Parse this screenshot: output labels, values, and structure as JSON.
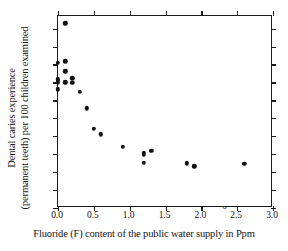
{
  "chart_data": {
    "type": "scatter",
    "title": "",
    "xlabel": "Fluoride (F) content of the public water supply in Ppm",
    "ylabel_line1": "Dental caries experience",
    "ylabel_line2": "(permanent teeth) per 100 children examined",
    "xlim": [
      0.0,
      3.0
    ],
    "ylim": [
      0,
      1070
    ],
    "xticks": [
      "0.0",
      "0.5",
      "1.0",
      "1.5",
      "2.0",
      "2.5",
      "3.0"
    ],
    "xtick_values": [
      0.0,
      0.5,
      1.0,
      1.5,
      2.0,
      2.5,
      3.0
    ],
    "yticks": [
      "0",
      "100",
      "200",
      "300",
      "400",
      "500",
      "600",
      "700",
      "800",
      "900",
      "1000"
    ],
    "ytick_values": [
      0,
      100,
      200,
      300,
      400,
      500,
      600,
      700,
      800,
      900,
      1000
    ],
    "grid": false,
    "legend": null,
    "marker": "filled-circle",
    "marker_color": "#111111",
    "points": [
      {
        "x": 0.1,
        "y": 1030
      },
      {
        "x": 0.0,
        "y": 808
      },
      {
        "x": 0.1,
        "y": 818
      },
      {
        "x": 0.1,
        "y": 762
      },
      {
        "x": 0.0,
        "y": 718
      },
      {
        "x": 0.2,
        "y": 722
      },
      {
        "x": 0.0,
        "y": 700
      },
      {
        "x": 0.1,
        "y": 700
      },
      {
        "x": 0.2,
        "y": 698
      },
      {
        "x": 0.0,
        "y": 662
      },
      {
        "x": 0.3,
        "y": 648
      },
      {
        "x": 0.4,
        "y": 555
      },
      {
        "x": 0.5,
        "y": 442
      },
      {
        "x": 0.6,
        "y": 410
      },
      {
        "x": 0.9,
        "y": 342
      },
      {
        "x": 1.2,
        "y": 308
      },
      {
        "x": 1.2,
        "y": 298
      },
      {
        "x": 1.3,
        "y": 320
      },
      {
        "x": 1.2,
        "y": 252
      },
      {
        "x": 1.8,
        "y": 250
      },
      {
        "x": 1.9,
        "y": 233
      },
      {
        "x": 2.6,
        "y": 245
      }
    ]
  }
}
